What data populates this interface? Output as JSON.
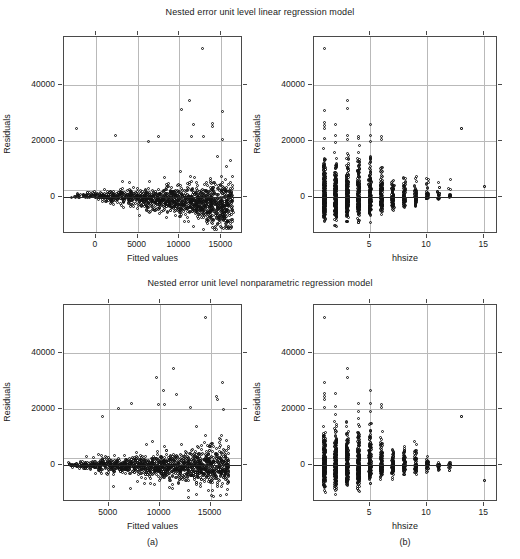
{
  "figure": {
    "width": 520,
    "height": 559,
    "background": "#ffffff",
    "foreground": "#1a1a1a",
    "grid_color": "#b9b9b9",
    "frame_color": "#4a4a4a",
    "point_color": "#121212"
  },
  "titles": {
    "top": "Nested error unit level linear regression model",
    "bottom": "Nested error unit level nonparametric regression model"
  },
  "captions": {
    "left": "(a)",
    "right": "(b)"
  },
  "chart_data": [
    {
      "id": "panel-top-left",
      "type": "scatter",
      "title": "Nested error unit level linear regression model",
      "xlabel": "Fitted values",
      "ylabel": "Residuals",
      "xlim": [
        -3800,
        17600
      ],
      "ylim": [
        -13000,
        57000
      ],
      "xticks": [
        0,
        5000,
        10000,
        15000
      ],
      "xticklabels": [
        "0",
        "5000",
        "10000",
        "15000"
      ],
      "yticks": [
        0,
        20000,
        40000
      ],
      "yticklabels": [
        "0",
        "20000",
        "40000"
      ],
      "grid": true,
      "hline": 0,
      "n_points": 1400,
      "shape_note": "dense wedge widening with fitted value; bulk between -9000 and 8000; right tail heteroscedastic",
      "outliers": [
        {
          "x": 12800,
          "y": 53000
        },
        {
          "x": -2300,
          "y": 24500
        },
        {
          "x": 11200,
          "y": 34500
        },
        {
          "x": 10200,
          "y": 31200
        },
        {
          "x": 15100,
          "y": 30700
        },
        {
          "x": 11700,
          "y": 26000
        },
        {
          "x": 13900,
          "y": 26300
        },
        {
          "x": 14000,
          "y": 25200
        },
        {
          "x": 7500,
          "y": 21800
        },
        {
          "x": 11400,
          "y": 21500
        },
        {
          "x": 12900,
          "y": 21800
        },
        {
          "x": 6300,
          "y": 20000
        },
        {
          "x": 15200,
          "y": 20700
        },
        {
          "x": 2400,
          "y": 21900
        }
      ]
    },
    {
      "id": "panel-top-right",
      "type": "scatter",
      "title": "Nested error unit level linear regression model",
      "xlabel": "hhsize",
      "ylabel": "Residuals",
      "xlim": [
        0.1,
        16.2
      ],
      "ylim": [
        -13000,
        57000
      ],
      "xticks": [
        5,
        10,
        15
      ],
      "xticklabels": [
        "5",
        "10",
        "15"
      ],
      "yticks": [
        0,
        20000,
        40000
      ],
      "yticklabels": [
        "0",
        "20000",
        "40000"
      ],
      "grid": true,
      "hline": 0,
      "categories": [
        1,
        2,
        3,
        4,
        5,
        6,
        7,
        8,
        9,
        10,
        11,
        12,
        13,
        15
      ],
      "column_counts": [
        260,
        230,
        230,
        210,
        170,
        120,
        80,
        70,
        60,
        45,
        22,
        14,
        1,
        1
      ],
      "column_spread": [
        {
          "hhsize": 1,
          "min": -9200,
          "max": 17500
        },
        {
          "hhsize": 2,
          "min": -10200,
          "max": 16500
        },
        {
          "hhsize": 3,
          "min": -8700,
          "max": 17000
        },
        {
          "hhsize": 4,
          "min": -9000,
          "max": 18500
        },
        {
          "hhsize": 5,
          "min": -9000,
          "max": 17000
        },
        {
          "hhsize": 6,
          "min": -6000,
          "max": 13000
        },
        {
          "hhsize": 7,
          "min": -6000,
          "max": 9000
        },
        {
          "hhsize": 8,
          "min": -4500,
          "max": 8200
        },
        {
          "hhsize": 9,
          "min": -3800,
          "max": 9000
        },
        {
          "hhsize": 10,
          "min": -500,
          "max": 9000
        },
        {
          "hhsize": 11,
          "min": -1200,
          "max": 5200
        },
        {
          "hhsize": 12,
          "min": 2500,
          "max": 6500
        },
        {
          "hhsize": 13,
          "min": 24500,
          "max": 24500
        },
        {
          "hhsize": 15,
          "min": 3800,
          "max": 3800
        }
      ],
      "outliers": [
        {
          "x": 1,
          "y": 53000
        },
        {
          "x": 1,
          "y": 31000
        },
        {
          "x": 1,
          "y": 26500
        },
        {
          "x": 1,
          "y": 25500
        },
        {
          "x": 1,
          "y": 24500
        },
        {
          "x": 1,
          "y": 21000
        },
        {
          "x": 2,
          "y": 26000
        },
        {
          "x": 2,
          "y": 22000
        },
        {
          "x": 2,
          "y": 19500
        },
        {
          "x": 3,
          "y": 34500
        },
        {
          "x": 3,
          "y": 31500
        },
        {
          "x": 3,
          "y": 22000
        },
        {
          "x": 3,
          "y": 20500
        },
        {
          "x": 4,
          "y": 21800
        },
        {
          "x": 4,
          "y": 21000
        },
        {
          "x": 5,
          "y": 26000
        },
        {
          "x": 5,
          "y": 22000
        },
        {
          "x": 5,
          "y": 20000
        },
        {
          "x": 6,
          "y": 21500
        },
        {
          "x": 6,
          "y": 20700
        },
        {
          "x": 13,
          "y": 24500
        },
        {
          "x": 15,
          "y": 3800
        }
      ]
    },
    {
      "id": "panel-bottom-left",
      "type": "scatter",
      "title": "Nested error unit level nonparametric regression model",
      "xlabel": "Fitted values",
      "ylabel": "Residuals",
      "xlim": [
        600,
        18200
      ],
      "ylim": [
        -13000,
        57000
      ],
      "xticks": [
        5000,
        10000,
        15000
      ],
      "xticklabels": [
        "5000",
        "10000",
        "15000"
      ],
      "yticks": [
        0,
        20000,
        40000
      ],
      "yticklabels": [
        "0",
        "20000",
        "40000"
      ],
      "grid": true,
      "hline": 0,
      "n_points": 1400,
      "shape_note": "dense horizontal band centred on zero, widening toward larger fitted values",
      "outliers": [
        {
          "x": 14500,
          "y": 52500
        },
        {
          "x": 11400,
          "y": 34500
        },
        {
          "x": 9700,
          "y": 31200
        },
        {
          "x": 16200,
          "y": 29500
        },
        {
          "x": 10400,
          "y": 26800
        },
        {
          "x": 11700,
          "y": 25200
        },
        {
          "x": 15600,
          "y": 24500
        },
        {
          "x": 15700,
          "y": 23500
        },
        {
          "x": 7200,
          "y": 22000
        },
        {
          "x": 9900,
          "y": 21800
        },
        {
          "x": 10500,
          "y": 21500
        },
        {
          "x": 6000,
          "y": 20300
        },
        {
          "x": 13000,
          "y": 20700
        },
        {
          "x": 16300,
          "y": 19800
        },
        {
          "x": 4400,
          "y": 17500
        }
      ]
    },
    {
      "id": "panel-bottom-right",
      "type": "scatter",
      "title": "Nested error unit level nonparametric regression model",
      "xlabel": "hhsize",
      "ylabel": "Residuals",
      "xlim": [
        0.1,
        16.2
      ],
      "ylim": [
        -13000,
        57000
      ],
      "xticks": [
        5,
        10,
        15
      ],
      "xticklabels": [
        "5",
        "10",
        "15"
      ],
      "yticks": [
        0,
        20000,
        40000
      ],
      "yticklabels": [
        "0",
        "20000",
        "40000"
      ],
      "grid": true,
      "hline": 0,
      "categories": [
        1,
        2,
        3,
        4,
        5,
        6,
        7,
        8,
        9,
        10,
        11,
        12,
        13,
        15
      ],
      "column_counts": [
        260,
        230,
        230,
        210,
        170,
        120,
        80,
        70,
        60,
        45,
        20,
        14,
        1,
        1
      ],
      "column_spread": [
        {
          "hhsize": 1,
          "min": -9500,
          "max": 14500
        },
        {
          "hhsize": 2,
          "min": -10200,
          "max": 15500
        },
        {
          "hhsize": 3,
          "min": -8500,
          "max": 17000
        },
        {
          "hhsize": 4,
          "min": -9200,
          "max": 17000
        },
        {
          "hhsize": 5,
          "min": -6500,
          "max": 15000
        },
        {
          "hhsize": 6,
          "min": -5000,
          "max": 12000
        },
        {
          "hhsize": 7,
          "min": -5000,
          "max": 8500
        },
        {
          "hhsize": 8,
          "min": -4500,
          "max": 7500
        },
        {
          "hhsize": 9,
          "min": -4000,
          "max": 8500
        },
        {
          "hhsize": 10,
          "min": -3000,
          "max": 5000
        },
        {
          "hhsize": 11,
          "min": -2800,
          "max": 900
        },
        {
          "hhsize": 12,
          "min": -2500,
          "max": 1500
        },
        {
          "hhsize": 13,
          "min": 17500,
          "max": 17500
        },
        {
          "hhsize": 15,
          "min": -5500,
          "max": -5500
        }
      ],
      "outliers": [
        {
          "x": 1,
          "y": 52500
        },
        {
          "x": 1,
          "y": 29500
        },
        {
          "x": 1,
          "y": 25500
        },
        {
          "x": 1,
          "y": 24500
        },
        {
          "x": 1,
          "y": 23500
        },
        {
          "x": 1,
          "y": 20500
        },
        {
          "x": 2,
          "y": 25500
        },
        {
          "x": 2,
          "y": 21000
        },
        {
          "x": 2,
          "y": 18000
        },
        {
          "x": 3,
          "y": 34500
        },
        {
          "x": 3,
          "y": 31200
        },
        {
          "x": 4,
          "y": 22000
        },
        {
          "x": 4,
          "y": 19000
        },
        {
          "x": 5,
          "y": 26800
        },
        {
          "x": 5,
          "y": 22000
        },
        {
          "x": 5,
          "y": 19000
        },
        {
          "x": 6,
          "y": 21800
        },
        {
          "x": 6,
          "y": 20500
        },
        {
          "x": 13,
          "y": 17500
        },
        {
          "x": 15,
          "y": -5500
        }
      ]
    }
  ]
}
